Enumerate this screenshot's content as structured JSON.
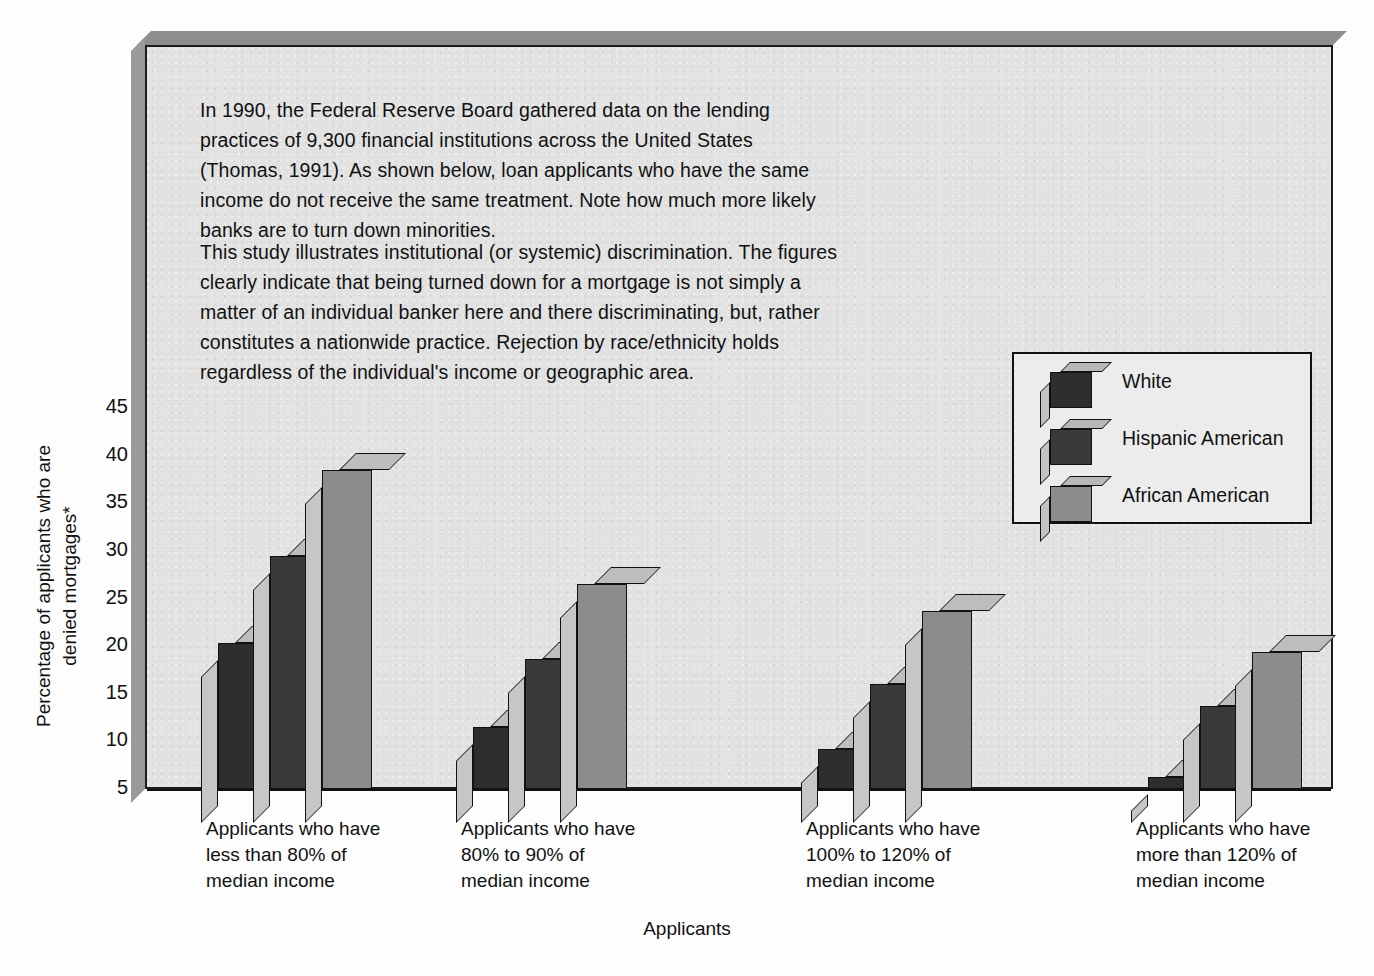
{
  "figure": {
    "paragraphs": [
      "In 1990, the Federal Reserve Board gathered data on the lending practices of 9,300 financial institutions across the United States (Thomas, 1991). As shown below, loan applicants who have the same income do not receive the same treatment. Note how much more likely banks are to turn down minorities.",
      "This study illustrates institutional (or systemic) discrimination. The figures clearly indicate that being turned down for a mortgage is not simply a matter of an individual banker here and there discriminating, but, rather constitutes a nationwide practice. Rejection by race/ethnicity holds regardless of the individual's income or geographic area."
    ]
  },
  "chart_data": {
    "type": "bar",
    "title": "",
    "xlabel": "Applicants",
    "ylabel": "Percentage of applicants who are denied mortgages*",
    "ylim": [
      5,
      45
    ],
    "yticks": [
      45,
      40,
      35,
      30,
      25,
      20,
      15,
      10,
      5
    ],
    "grid": false,
    "legend_position": "upper right",
    "categories": [
      "Applicants who have less than 80% of median income",
      "Applicants who have 80% to 90% of median income",
      "Applicants who have 100% to 120% of median income",
      "Applicants who have more than 120% of median income"
    ],
    "category_lines": [
      [
        "Applicants who have",
        "less than 80% of",
        "median income"
      ],
      [
        "Applicants who have",
        "80% to 90% of",
        "median income"
      ],
      [
        "Applicants who have",
        "100% to 120% of",
        "median income"
      ],
      [
        "Applicants who have",
        "more than 120% of",
        "median income"
      ]
    ],
    "series": [
      {
        "name": "White",
        "color": "#2e2e2e",
        "values": [
          20.3,
          11.5,
          9.2,
          6.3
        ]
      },
      {
        "name": "Hispanic American",
        "color": "#3a3a3a",
        "values": [
          29.5,
          18.7,
          16.0,
          13.7
        ]
      },
      {
        "name": "African American",
        "color": "#8c8c8c",
        "values": [
          38.5,
          26.5,
          23.7,
          19.4
        ]
      }
    ]
  },
  "legend": {
    "items": [
      {
        "label": "White",
        "color": "#2e2e2e"
      },
      {
        "label": "Hispanic American",
        "color": "#3a3a3a"
      },
      {
        "label": "African American",
        "color": "#8c8c8c"
      }
    ]
  }
}
